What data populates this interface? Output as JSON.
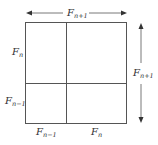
{
  "diagram": {
    "labels": {
      "top": {
        "base": "F",
        "sub": "n+1"
      },
      "right": {
        "base": "F",
        "sub": "n+1"
      },
      "left_upper": {
        "base": "F",
        "sub": "n"
      },
      "left_lower": {
        "base": "F",
        "sub": "n−1"
      },
      "bottom_left": {
        "base": "F",
        "sub": "n−1"
      },
      "bottom_right": {
        "base": "F",
        "sub": "n"
      }
    },
    "colors": {
      "line": "#555555",
      "text": "#333333"
    }
  }
}
